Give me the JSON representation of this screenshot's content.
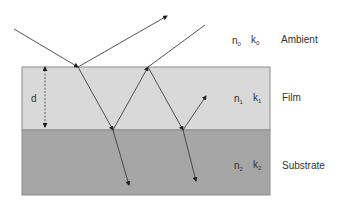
{
  "colors": {
    "background": "#ffffff",
    "film": "#d9d9d9",
    "substrate": "#a6a6a6",
    "border": "#8c8c8c",
    "ray": "#404040",
    "text": "#333333"
  },
  "layers": {
    "ambient": {
      "name": "Ambient",
      "n_symbol": "n",
      "n_sub": "0",
      "k_symbol": "k",
      "k_sub": "0"
    },
    "film": {
      "name": "Film",
      "n_symbol": "n",
      "n_sub": "1",
      "k_symbol": "k",
      "k_sub": "1"
    },
    "substrate": {
      "name": "Substrate",
      "n_symbol": "n",
      "n_sub": "2",
      "k_symbol": "k",
      "k_sub": "2"
    }
  },
  "thickness_label": "d",
  "geometry": {
    "film_rect": {
      "x": 22,
      "y": 67,
      "w": 248,
      "h": 63
    },
    "substrate_rect": {
      "x": 22,
      "y": 130,
      "w": 248,
      "h": 65
    },
    "rays": [
      {
        "id": "incident",
        "x1": 14,
        "y1": 29,
        "x2": 78,
        "y2": 67,
        "arrow": true
      },
      {
        "id": "reflected-1",
        "x1": 78,
        "y1": 67,
        "x2": 167,
        "y2": 16,
        "arrow": true
      },
      {
        "id": "refracted-film-1",
        "x1": 78,
        "y1": 67,
        "x2": 113,
        "y2": 130,
        "arrow": true
      },
      {
        "id": "transmitted-1",
        "x1": 113,
        "y1": 130,
        "x2": 129,
        "y2": 185,
        "arrow": true
      },
      {
        "id": "internal-reflect-1",
        "x1": 113,
        "y1": 130,
        "x2": 148,
        "y2": 67,
        "arrow": true
      },
      {
        "id": "reflected-2",
        "x1": 148,
        "y1": 67,
        "x2": 205,
        "y2": 25,
        "arrow": false
      },
      {
        "id": "refracted-film-2",
        "x1": 148,
        "y1": 67,
        "x2": 183,
        "y2": 130,
        "arrow": true
      },
      {
        "id": "transmitted-2",
        "x1": 183,
        "y1": 130,
        "x2": 196,
        "y2": 181,
        "arrow": true
      },
      {
        "id": "internal-reflect-2",
        "x1": 183,
        "y1": 130,
        "x2": 206,
        "y2": 96,
        "arrow": true
      }
    ],
    "thickness_marker": {
      "x": 45,
      "y1": 68,
      "y2": 129
    }
  }
}
